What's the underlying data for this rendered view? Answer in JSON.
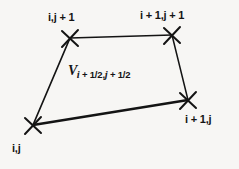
{
  "figure": {
    "type": "diagram",
    "background_color": "#f7f6f4",
    "ink_color": "#141414",
    "vertex_marker": "x-cross",
    "vertices": [
      {
        "id": "top-left",
        "label": "i,j + 1",
        "x": 70,
        "y": 38
      },
      {
        "id": "top-right",
        "label": "i + 1,j + 1",
        "x": 172,
        "y": 35
      },
      {
        "id": "bottom-right",
        "label": "i + 1,j",
        "x": 188,
        "y": 100
      },
      {
        "id": "bottom-left",
        "label": "i,j",
        "x": 33,
        "y": 125
      }
    ],
    "edges": [
      {
        "from": "top-left",
        "to": "top-right",
        "width": 1.6
      },
      {
        "from": "top-right",
        "to": "bottom-right",
        "width": 1.5
      },
      {
        "from": "bottom-right",
        "to": "bottom-left",
        "width": 2.4
      },
      {
        "from": "bottom-left",
        "to": "top-left",
        "width": 1.6
      }
    ],
    "cell_label": {
      "symbol": "V",
      "subscript": "i + 1/2,j + 1/2",
      "subscript_parts": {
        "i": "i",
        "first_term": " + 1/2,",
        "j": "j",
        "second_term": " + 1/2"
      },
      "full_text": "Vi + 1/2,j + 1/2"
    }
  }
}
